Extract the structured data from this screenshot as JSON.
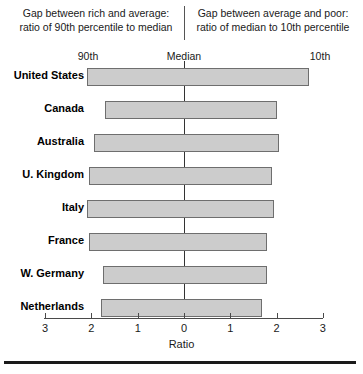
{
  "header": {
    "left_caption_line1": "Gap between rich and average:",
    "left_caption_line2": "ratio of 90th percentile to median",
    "right_caption_line1": "Gap between average and poor:",
    "right_caption_line2": "ratio of median to 10th percentile",
    "label_left": "90th",
    "label_center": "Median",
    "label_right": "10th"
  },
  "colors": {
    "bar_fill": "#cccccc",
    "bar_border": "#6e6e6e",
    "axis": "#4a4a4a",
    "text": "#1a1a1a"
  },
  "chart_data": {
    "type": "bar",
    "orientation": "horizontal-diverging",
    "title": "",
    "xlabel": "Ratio",
    "ylabel": "",
    "xlim": [
      -3,
      3
    ],
    "xticks": [
      -3,
      -2,
      -1,
      0,
      1,
      2,
      3
    ],
    "xtick_labels": [
      "3",
      "2",
      "1",
      "0",
      "1",
      "2",
      "3"
    ],
    "grid": false,
    "legend": "none",
    "center_line_value": 0,
    "annotations": {
      "left_side": "Gap between rich and average: ratio of 90th percentile to median",
      "right_side": "Gap between average and poor: ratio of median to 10th percentile"
    },
    "categories": [
      "United States",
      "Canada",
      "Australia",
      "U. Kingdom",
      "Italy",
      "France",
      "W. Germany",
      "Netherlands"
    ],
    "series": [
      {
        "name": "Gap between rich and average (ratio of 90th percentile to median)",
        "side": "left",
        "values": [
          2.1,
          1.7,
          1.95,
          2.05,
          2.1,
          2.05,
          1.75,
          1.8
        ]
      },
      {
        "name": "Gap between average and poor (ratio of median to 10th percentile)",
        "side": "right",
        "values": [
          2.7,
          2.0,
          2.05,
          1.9,
          1.95,
          1.8,
          1.8,
          1.68
        ]
      }
    ]
  }
}
